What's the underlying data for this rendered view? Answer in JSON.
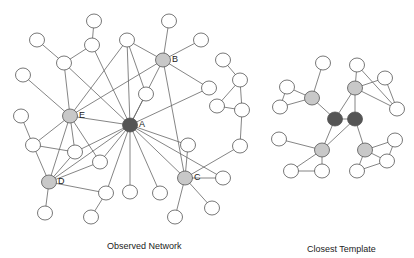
{
  "captions": {
    "observed": "Observed Network",
    "template": "Closest Template"
  },
  "colors": {
    "hub": "#555555",
    "secondary": "#c8c8c8",
    "leaf": "#ffffff",
    "stroke": "#555555",
    "edge": "#666666"
  },
  "observed_network": {
    "labeled_nodes": [
      {
        "id": "A",
        "label": "A",
        "role": "hub"
      },
      {
        "id": "B",
        "label": "B",
        "role": "secondary"
      },
      {
        "id": "C",
        "label": "C",
        "role": "secondary"
      },
      {
        "id": "D",
        "label": "D",
        "role": "secondary"
      },
      {
        "id": "E",
        "label": "E",
        "role": "secondary"
      }
    ],
    "leaf_count": 28,
    "edges": [
      [
        "A",
        "E"
      ],
      [
        "A",
        "B"
      ],
      [
        "A",
        "C"
      ],
      [
        "A",
        "D"
      ],
      [
        "A",
        "n15"
      ],
      [
        "A",
        "n16"
      ],
      [
        "A",
        "n19"
      ],
      [
        "A",
        "n20"
      ],
      [
        "A",
        "n21"
      ],
      [
        "A",
        "n8"
      ],
      [
        "A",
        "n9"
      ],
      [
        "A",
        "n12"
      ],
      [
        "A",
        "n13"
      ],
      [
        "A",
        "n14"
      ],
      [
        "A",
        "n4"
      ],
      [
        "B",
        "n17"
      ],
      [
        "B",
        "n18"
      ],
      [
        "B",
        "n15"
      ],
      [
        "B",
        "n19"
      ],
      [
        "B",
        "E"
      ],
      [
        "B",
        "C"
      ],
      [
        "E",
        "n4"
      ],
      [
        "E",
        "n5"
      ],
      [
        "E",
        "n7"
      ],
      [
        "E",
        "n15"
      ],
      [
        "E",
        "n8"
      ],
      [
        "E",
        "D"
      ],
      [
        "E",
        "n9"
      ],
      [
        "D",
        "n7"
      ],
      [
        "D",
        "n8"
      ],
      [
        "D",
        "n9"
      ],
      [
        "D",
        "n12"
      ],
      [
        "D",
        "n10"
      ],
      [
        "C",
        "n20"
      ],
      [
        "C",
        "n22"
      ],
      [
        "C",
        "n23"
      ],
      [
        "C",
        "n28"
      ],
      [
        "C",
        "n21"
      ],
      [
        "n1",
        "n2"
      ],
      [
        "n2",
        "n4"
      ],
      [
        "n2",
        "A"
      ],
      [
        "n3",
        "n4"
      ],
      [
        "n6",
        "n7"
      ],
      [
        "n7",
        "n8"
      ],
      [
        "n12",
        "n11"
      ],
      [
        "n15",
        "n16"
      ],
      [
        "n24",
        "n25"
      ],
      [
        "n25",
        "n26"
      ],
      [
        "n25",
        "n27"
      ],
      [
        "n26",
        "n27"
      ],
      [
        "n27",
        "n28"
      ]
    ]
  },
  "template_network": {
    "hub_count": 2,
    "secondary_count": 4,
    "leaf_count": 12
  }
}
